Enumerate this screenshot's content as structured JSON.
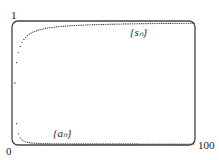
{
  "chart_data": {
    "type": "scatter",
    "title": "",
    "xlabel": "",
    "ylabel": "",
    "xlim": [
      0,
      100
    ],
    "ylim": [
      0,
      1
    ],
    "x_tick_labels": [
      "0",
      "100"
    ],
    "y_tick_labels": [
      "0",
      "1"
    ],
    "grid": false,
    "legend": "none (inline labels)",
    "series": [
      {
        "name": "{s_n}",
        "label": "{sₙ}",
        "formula": "n/(n+1)",
        "x_range": [
          1,
          100
        ],
        "values_sample": {
          "1": 0.5,
          "2": 0.667,
          "3": 0.75,
          "5": 0.833,
          "10": 0.909,
          "20": 0.952,
          "50": 0.98,
          "100": 0.99
        }
      },
      {
        "name": "{a_n}",
        "label": "{aₙ}",
        "formula": "1/(n(n+1))",
        "x_range": [
          1,
          100
        ],
        "values_sample": {
          "1": 0.5,
          "2": 0.167,
          "3": 0.083,
          "5": 0.033,
          "10": 0.009,
          "20": 0.002,
          "50": 0.0004,
          "100": 0.0001
        }
      }
    ],
    "annotations": [
      {
        "text": "{sₙ}",
        "near": "upper curve, x≈75"
      },
      {
        "text": "{aₙ}",
        "near": "lower curve, x≈15"
      }
    ]
  },
  "labels": {
    "y_top": "1",
    "origin": "0",
    "x_right": "100",
    "s_label": "{sₙ}",
    "a_label": "{aₙ}"
  }
}
